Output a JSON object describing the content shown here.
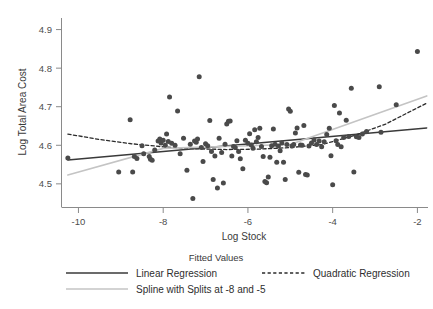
{
  "chart_data": {
    "type": "scatter",
    "title": "",
    "xlabel": "Log Stock",
    "ylabel": "Log Total Area Cost",
    "xlim": [
      -10.4,
      -1.75
    ],
    "ylim": [
      4.44,
      4.93
    ],
    "xticks": [
      -10,
      -8,
      -6,
      -4,
      -2
    ],
    "xticklabels": [
      "-10",
      "-8",
      "-6",
      "-4",
      "-2"
    ],
    "yticks": [
      4.5,
      4.6,
      4.7,
      4.8,
      4.9
    ],
    "yticklabels": [
      "4.5",
      "4.6",
      "4.7",
      "4.8",
      "4.9"
    ],
    "grid": false,
    "marker_color": "#4a4a4a",
    "marker_size": 5,
    "points": [
      [
        -10.25,
        4.567
      ],
      [
        -9.05,
        4.531
      ],
      [
        -8.78,
        4.666
      ],
      [
        -8.72,
        4.531
      ],
      [
        -8.68,
        4.571
      ],
      [
        -8.62,
        4.566
      ],
      [
        -8.5,
        4.599
      ],
      [
        -8.46,
        4.578
      ],
      [
        -8.33,
        4.571
      ],
      [
        -8.3,
        4.564
      ],
      [
        -8.26,
        4.561
      ],
      [
        -8.2,
        4.588
      ],
      [
        -8.12,
        4.611
      ],
      [
        -8.08,
        4.616
      ],
      [
        -8.05,
        4.606
      ],
      [
        -8.0,
        4.613
      ],
      [
        -7.95,
        4.6
      ],
      [
        -7.92,
        4.629
      ],
      [
        -7.88,
        4.61
      ],
      [
        -7.85,
        4.725
      ],
      [
        -7.8,
        4.605
      ],
      [
        -7.72,
        4.6
      ],
      [
        -7.66,
        4.689
      ],
      [
        -7.6,
        4.578
      ],
      [
        -7.52,
        4.618
      ],
      [
        -7.44,
        4.535
      ],
      [
        -7.36,
        4.603
      ],
      [
        -7.3,
        4.462
      ],
      [
        -7.26,
        4.611
      ],
      [
        -7.22,
        4.608
      ],
      [
        -7.19,
        4.616
      ],
      [
        -7.15,
        4.778
      ],
      [
        -7.1,
        4.594
      ],
      [
        -7.06,
        4.558
      ],
      [
        -7.0,
        4.604
      ],
      [
        -6.95,
        4.599
      ],
      [
        -6.9,
        4.664
      ],
      [
        -6.86,
        4.584
      ],
      [
        -6.82,
        4.511
      ],
      [
        -6.78,
        4.572
      ],
      [
        -6.72,
        4.489
      ],
      [
        -6.68,
        4.618
      ],
      [
        -6.62,
        4.581
      ],
      [
        -6.58,
        4.502
      ],
      [
        -6.54,
        4.603
      ],
      [
        -6.5,
        4.655
      ],
      [
        -6.46,
        4.662
      ],
      [
        -6.42,
        4.663
      ],
      [
        -6.38,
        4.572
      ],
      [
        -6.34,
        4.597
      ],
      [
        -6.3,
        4.594
      ],
      [
        -6.26,
        4.612
      ],
      [
        -6.22,
        4.584
      ],
      [
        -6.18,
        4.565
      ],
      [
        -6.12,
        4.539
      ],
      [
        -6.06,
        4.613
      ],
      [
        -6.0,
        4.605
      ],
      [
        -5.96,
        4.63
      ],
      [
        -5.92,
        4.601
      ],
      [
        -5.88,
        4.592
      ],
      [
        -5.84,
        4.64
      ],
      [
        -5.8,
        4.609
      ],
      [
        -5.76,
        4.62
      ],
      [
        -5.72,
        4.644
      ],
      [
        -5.68,
        4.597
      ],
      [
        -5.64,
        4.571
      ],
      [
        -5.6,
        4.506
      ],
      [
        -5.56,
        4.503
      ],
      [
        -5.52,
        4.518
      ],
      [
        -5.48,
        4.569
      ],
      [
        -5.44,
        4.599
      ],
      [
        -5.4,
        4.642
      ],
      [
        -5.36,
        4.603
      ],
      [
        -5.32,
        4.556
      ],
      [
        -5.28,
        4.598
      ],
      [
        -5.24,
        4.586
      ],
      [
        -5.2,
        4.606
      ],
      [
        -5.16,
        4.556
      ],
      [
        -5.12,
        4.511
      ],
      [
        -5.08,
        4.602
      ],
      [
        -5.04,
        4.694
      ],
      [
        -5.0,
        4.688
      ],
      [
        -4.96,
        4.598
      ],
      [
        -4.92,
        4.602
      ],
      [
        -4.88,
        4.632
      ],
      [
        -4.84,
        4.645
      ],
      [
        -4.8,
        4.53
      ],
      [
        -4.76,
        4.601
      ],
      [
        -4.72,
        4.6
      ],
      [
        -4.68,
        4.651
      ],
      [
        -4.64,
        4.524
      ],
      [
        -4.6,
        4.523
      ],
      [
        -4.56,
        4.598
      ],
      [
        -4.5,
        4.606
      ],
      [
        -4.44,
        4.614
      ],
      [
        -4.38,
        4.602
      ],
      [
        -4.32,
        4.611
      ],
      [
        -4.26,
        4.596
      ],
      [
        -4.2,
        4.609
      ],
      [
        -4.14,
        4.628
      ],
      [
        -4.08,
        4.644
      ],
      [
        -4.04,
        4.573
      ],
      [
        -4.0,
        4.498
      ],
      [
        -3.96,
        4.703
      ],
      [
        -3.92,
        4.612
      ],
      [
        -3.88,
        4.602
      ],
      [
        -3.84,
        4.684
      ],
      [
        -3.8,
        4.596
      ],
      [
        -3.74,
        4.62
      ],
      [
        -3.68,
        4.665
      ],
      [
        -3.62,
        4.623
      ],
      [
        -3.56,
        4.748
      ],
      [
        -3.5,
        4.531
      ],
      [
        -3.44,
        4.622
      ],
      [
        -3.38,
        4.62
      ],
      [
        -3.3,
        4.629
      ],
      [
        -3.2,
        4.636
      ],
      [
        -2.9,
        4.752
      ],
      [
        -2.86,
        4.634
      ],
      [
        -2.5,
        4.705
      ],
      [
        -2.0,
        4.843
      ]
    ],
    "series": [
      {
        "name": "Linear Regression",
        "style": "solid",
        "color": "#3a3a3a",
        "width": 1.4,
        "points": [
          [
            -10.25,
            4.562
          ],
          [
            -1.78,
            4.645
          ]
        ]
      },
      {
        "name": "Quadratic Regression",
        "style": "dashed",
        "color": "#2b2b2b",
        "width": 1.3,
        "points": [
          [
            -10.25,
            4.629
          ],
          [
            -9.5,
            4.615
          ],
          [
            -8.75,
            4.604
          ],
          [
            -8.0,
            4.596
          ],
          [
            -7.25,
            4.591
          ],
          [
            -6.5,
            4.589
          ],
          [
            -5.75,
            4.59
          ],
          [
            -5.0,
            4.594
          ],
          [
            -4.25,
            4.602
          ],
          [
            -3.5,
            4.625
          ],
          [
            -2.75,
            4.655
          ],
          [
            -2.0,
            4.697
          ],
          [
            -1.78,
            4.709
          ]
        ]
      },
      {
        "name": "Spline with Splits at -8 and -5",
        "style": "solid",
        "color": "#c4c4c4",
        "width": 1.6,
        "points": [
          [
            -10.25,
            4.523
          ],
          [
            -8.0,
            4.592
          ],
          [
            -5.0,
            4.602
          ],
          [
            -1.78,
            4.728
          ]
        ]
      }
    ]
  },
  "legend": {
    "title": "Fitted Values",
    "entries": [
      {
        "label": "Linear Regression",
        "style": "solid",
        "color": "#3a3a3a"
      },
      {
        "label": "Quadratic Regression",
        "style": "dashed",
        "color": "#2b2b2b"
      },
      {
        "label": "Spline with Splits at -8 and -5",
        "style": "solid",
        "color": "#c4c4c4"
      }
    ]
  }
}
